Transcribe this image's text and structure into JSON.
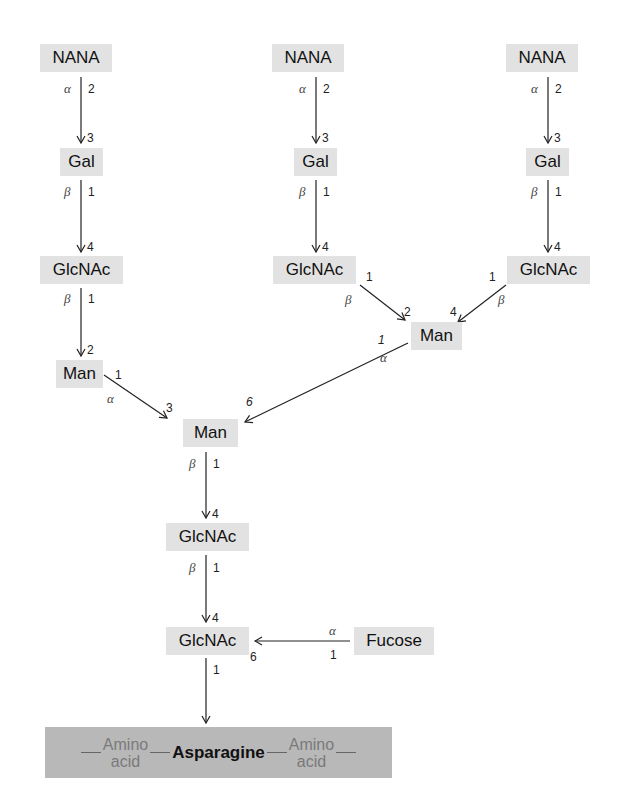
{
  "nodes": {
    "nana_left": "NANA",
    "nana_mid": "NANA",
    "nana_right": "NANA",
    "gal_left": "Gal",
    "gal_mid": "Gal",
    "gal_right": "Gal",
    "glcnac_left": "GlcNAc",
    "glcnac_mid": "GlcNAc",
    "glcnac_right": "GlcNAc",
    "man_left": "Man",
    "man_right": "Man",
    "man_core": "Man",
    "glcnac_core1": "GlcNAc",
    "glcnac_core2": "GlcNAc",
    "fucose": "Fucose"
  },
  "linkages": {
    "alpha": "α",
    "beta": "β",
    "n1": "1",
    "n2": "2",
    "n3": "3",
    "n4": "4",
    "n6": "6"
  },
  "peptide": {
    "left_aa_line1": "Amino",
    "left_aa_line2": "acid",
    "center": "Asparagine",
    "right_aa_line1": "Amino",
    "right_aa_line2": "acid"
  }
}
